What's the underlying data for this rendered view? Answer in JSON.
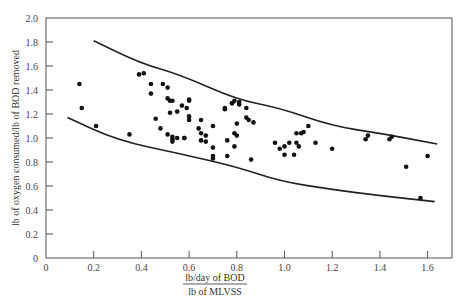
{
  "chart_data": {
    "type": "scatter",
    "title": "",
    "xlabel_numerator": "lb/day of BOD",
    "xlabel_denominator": "lb of MLVSS",
    "xlabel": "lb/day of BOD / lb of MLVSS",
    "ylabel": "lb of oxygen consumed/lb of BOD removed",
    "xlim": [
      0,
      1.7
    ],
    "ylim": [
      0,
      2.0
    ],
    "x_ticks": [
      0,
      0.2,
      0.4,
      0.6,
      0.8,
      1.0,
      1.2,
      1.4,
      1.6
    ],
    "x_tick_labels": [
      "0",
      "0.2",
      "0.4",
      "0.6",
      "0.8",
      "1.0",
      "1.2",
      "1.4",
      "1.6"
    ],
    "y_ticks": [
      0,
      0.2,
      0.4,
      0.6,
      0.8,
      1.0,
      1.2,
      1.4,
      1.6,
      1.8,
      2.0
    ],
    "y_tick_labels": [
      "0",
      "0.2",
      "0.4",
      "0.6",
      "0.8",
      "1.0",
      "1.2",
      "1.4",
      "1.6",
      "1.8",
      "2.0"
    ],
    "grid": false,
    "legend": null,
    "series": [
      {
        "name": "observations",
        "kind": "scatter",
        "points": [
          [
            0.14,
            1.45
          ],
          [
            0.15,
            1.25
          ],
          [
            0.21,
            1.1
          ],
          [
            0.35,
            1.03
          ],
          [
            0.39,
            1.53
          ],
          [
            0.41,
            1.54
          ],
          [
            0.44,
            1.45
          ],
          [
            0.44,
            1.37
          ],
          [
            0.46,
            1.16
          ],
          [
            0.48,
            1.08
          ],
          [
            0.49,
            1.45
          ],
          [
            0.51,
            1.42
          ],
          [
            0.51,
            1.33
          ],
          [
            0.52,
            1.31
          ],
          [
            0.53,
            1.31
          ],
          [
            0.52,
            1.21
          ],
          [
            0.55,
            1.22
          ],
          [
            0.59,
            1.25
          ],
          [
            0.51,
            1.03
          ],
          [
            0.53,
            1.01
          ],
          [
            0.53,
            0.99
          ],
          [
            0.55,
            1.0
          ],
          [
            0.53,
            0.97
          ],
          [
            0.58,
            1.0
          ],
          [
            0.57,
            1.27
          ],
          [
            0.6,
            1.31
          ],
          [
            0.6,
            1.32
          ],
          [
            0.6,
            1.18
          ],
          [
            0.6,
            1.15
          ],
          [
            0.65,
            1.15
          ],
          [
            0.64,
            1.08
          ],
          [
            0.65,
            1.04
          ],
          [
            0.67,
            1.02
          ],
          [
            0.65,
            0.98
          ],
          [
            0.67,
            0.97
          ],
          [
            0.7,
            1.1
          ],
          [
            0.7,
            0.92
          ],
          [
            0.58,
            1.0
          ],
          [
            0.7,
            0.85
          ],
          [
            0.7,
            0.83
          ],
          [
            0.75,
            1.24
          ],
          [
            0.78,
            1.29
          ],
          [
            0.79,
            1.31
          ],
          [
            0.76,
            0.98
          ],
          [
            0.8,
            1.02
          ],
          [
            0.79,
            1.04
          ],
          [
            0.79,
            0.93
          ],
          [
            0.76,
            0.85
          ],
          [
            0.75,
            1.25
          ],
          [
            0.78,
            1.29
          ],
          [
            0.81,
            1.3
          ],
          [
            0.81,
            1.28
          ],
          [
            0.84,
            1.25
          ],
          [
            0.84,
            1.17
          ],
          [
            0.85,
            1.15
          ],
          [
            0.87,
            1.13
          ],
          [
            0.8,
            1.12
          ],
          [
            0.86,
            0.82
          ],
          [
            0.96,
            0.96
          ],
          [
            0.98,
            0.91
          ],
          [
            1.0,
            0.93
          ],
          [
            1.02,
            0.96
          ],
          [
            1.0,
            0.86
          ],
          [
            1.04,
            0.86
          ],
          [
            1.05,
            0.96
          ],
          [
            1.06,
            0.93
          ],
          [
            1.05,
            1.04
          ],
          [
            1.07,
            1.04
          ],
          [
            1.08,
            1.05
          ],
          [
            1.1,
            1.1
          ],
          [
            1.13,
            0.96
          ],
          [
            1.2,
            0.91
          ],
          [
            1.34,
            0.99
          ],
          [
            1.35,
            1.02
          ],
          [
            1.44,
            0.99
          ],
          [
            1.45,
            1.01
          ],
          [
            1.51,
            0.76
          ],
          [
            1.57,
            0.5
          ],
          [
            1.6,
            0.85
          ]
        ]
      },
      {
        "name": "upper-bound",
        "kind": "line",
        "points": [
          [
            0.2,
            1.81
          ],
          [
            0.4,
            1.62
          ],
          [
            0.56,
            1.53
          ],
          [
            0.8,
            1.32
          ],
          [
            0.98,
            1.25
          ],
          [
            1.2,
            1.1
          ],
          [
            1.4,
            1.04
          ],
          [
            1.64,
            0.95
          ]
        ]
      },
      {
        "name": "lower-bound",
        "kind": "line",
        "points": [
          [
            0.09,
            1.17
          ],
          [
            0.3,
            0.98
          ],
          [
            0.56,
            0.87
          ],
          [
            0.8,
            0.76
          ],
          [
            0.98,
            0.64
          ],
          [
            1.2,
            0.57
          ],
          [
            1.4,
            0.52
          ],
          [
            1.63,
            0.47
          ]
        ]
      }
    ]
  }
}
